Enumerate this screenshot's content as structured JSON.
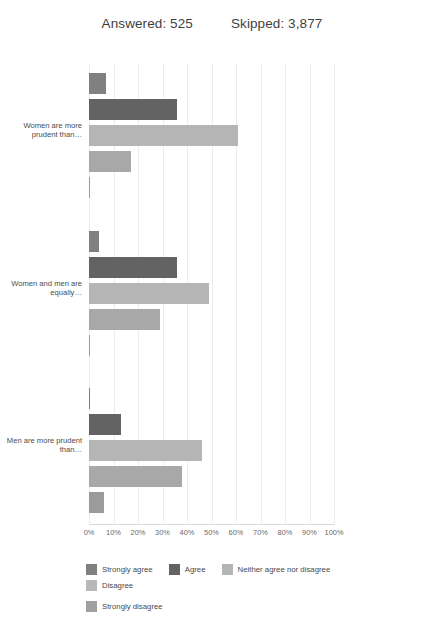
{
  "header": {
    "answered": "Answered: 525",
    "skipped": "Skipped: 3,877"
  },
  "chart_data": {
    "type": "bar",
    "orientation": "horizontal",
    "title": "",
    "xlabel": "",
    "ylabel": "",
    "xlim": [
      0,
      100
    ],
    "grid": true,
    "legend_position": "bottom",
    "tick_labels": [
      "0%",
      "10%",
      "20%",
      "30%",
      "40%",
      "50%",
      "60%",
      "70%",
      "80%",
      "90%",
      "100%"
    ],
    "tick_values": [
      0,
      10,
      20,
      30,
      40,
      50,
      60,
      70,
      80,
      90,
      100
    ],
    "categories": [
      "Women are more prudent than…",
      "Women and men are equally…",
      "Men are more prudent than…"
    ],
    "series": [
      {
        "name": "Strongly agree",
        "color": "#808080",
        "values": [
          7,
          4,
          0.5
        ]
      },
      {
        "name": "Agree",
        "color": "#636363",
        "values": [
          36,
          36,
          13
        ]
      },
      {
        "name": "Neither agree nor disagree",
        "color": "#b5b5b5",
        "values": [
          61,
          49,
          46
        ]
      },
      {
        "name": "Disagree",
        "color": "#a8a8a8",
        "values": [
          17,
          29,
          38
        ]
      },
      {
        "name": "Strongly disagree",
        "color": "#9b9b9b",
        "values": [
          0.5,
          0.5,
          6
        ]
      }
    ]
  },
  "legend": {
    "items": [
      {
        "label": "Strongly agree",
        "color": "#808080"
      },
      {
        "label": "Agree",
        "color": "#636363"
      },
      {
        "label": "Neither agree nor disagree",
        "color": "#b5b5b5"
      },
      {
        "label": "Disagree",
        "color": "#b8b8b8"
      },
      {
        "label": "Strongly disagree",
        "color": "#a0a0a0"
      }
    ]
  }
}
